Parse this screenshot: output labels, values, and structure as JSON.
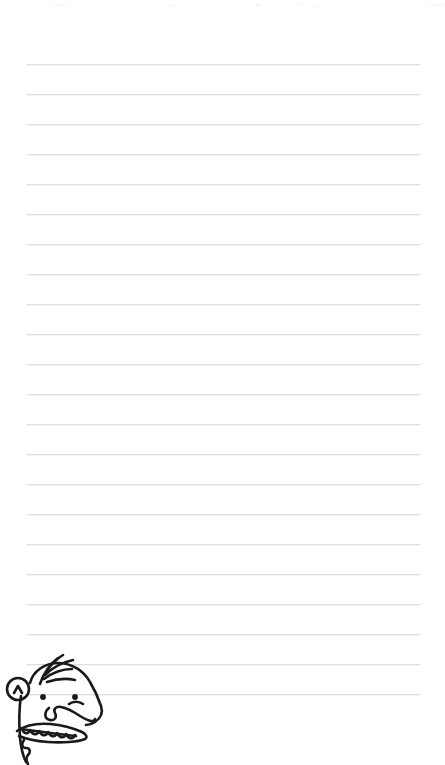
{
  "page": {
    "kind": "lined-notebook-page",
    "width": 445,
    "height": 765,
    "background_color": "#ffffff"
  },
  "ruled_lines": {
    "count": 22,
    "color": "#dedede",
    "shadow_color": "#f3f3f3",
    "thickness_px": 1,
    "left_x": 27,
    "right_x": 420,
    "first_y": 64,
    "spacing_y": 30,
    "y_positions": [
      64,
      94,
      124,
      154,
      184,
      214,
      244,
      274,
      304,
      334,
      364,
      394,
      424,
      454,
      484,
      514,
      544,
      574,
      604,
      634,
      664,
      694
    ]
  },
  "scan_noise": {
    "present": true,
    "top_y": 0,
    "height": 12,
    "color": "#eeeeee"
  },
  "character": {
    "name": "wimpy-kid-face",
    "description": "Cartoon boy's head in profile-ish three-quarter view peeking over the bottom edge",
    "stroke_color": "#1a1a1a",
    "fill_color": "#ffffff",
    "parts": [
      "hair-tuft",
      "head-outline",
      "ear",
      "left-eye",
      "right-eye",
      "eyebrow",
      "nose",
      "mouth",
      "teeth",
      "chin"
    ],
    "hair_strands": 3,
    "teeth_count": 6,
    "position": {
      "left": 0,
      "top": 652,
      "width": 120,
      "height": 113
    }
  }
}
